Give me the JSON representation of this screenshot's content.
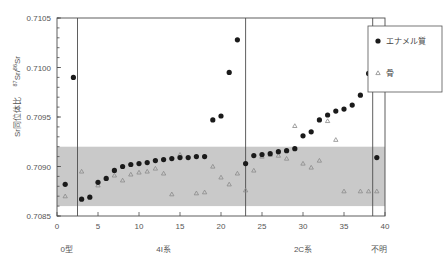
{
  "chart_data": {
    "type": "scatter",
    "title": "",
    "xlabel": "",
    "ylabel": "Sr同位体比  87Sr/86Sr",
    "ylabel_main": "Sr同位体比",
    "ylabel_sup": "87Sr/86Sr",
    "xlim": [
      0,
      40
    ],
    "ylim": [
      0.7085,
      0.7105
    ],
    "xticks": [
      0,
      5,
      10,
      15,
      20,
      25,
      30,
      35,
      40
    ],
    "yticks": [
      0.7085,
      0.709,
      0.7095,
      0.71,
      0.7105
    ],
    "ytick_labels": [
      "0.7085",
      "0.7090",
      "0.7095",
      "0.7100",
      "0.7105"
    ],
    "xtick_labels": [
      "0",
      "5",
      "10",
      "15",
      "20",
      "25",
      "30",
      "35",
      "40"
    ],
    "grid": false,
    "legend_position": "right-top",
    "shaded_band": {
      "label": "local range band",
      "y_min": 0.7086,
      "y_max": 0.7092,
      "color": "#c9c9c9"
    },
    "group_dividers": [
      2.5,
      23.0,
      38.5
    ],
    "group_labels": [
      {
        "label": "0型",
        "x": 1.2
      },
      {
        "label": "4I系",
        "x": 13.0
      },
      {
        "label": "2C系",
        "x": 30.0
      },
      {
        "label": "不明",
        "x": 39.3
      }
    ],
    "series": [
      {
        "name": "エナメル質",
        "marker": "filled-circle",
        "color": "#1a1a1a",
        "points": [
          {
            "x": 1,
            "y": 0.70882
          },
          {
            "x": 2,
            "y": 0.7099
          },
          {
            "x": 3,
            "y": 0.70867
          },
          {
            "x": 4,
            "y": 0.70869
          },
          {
            "x": 5,
            "y": 0.70884
          },
          {
            "x": 6,
            "y": 0.70888
          },
          {
            "x": 7,
            "y": 0.70896
          },
          {
            "x": 8,
            "y": 0.709
          },
          {
            "x": 9,
            "y": 0.70902
          },
          {
            "x": 10,
            "y": 0.70903
          },
          {
            "x": 11,
            "y": 0.70904
          },
          {
            "x": 12,
            "y": 0.70906
          },
          {
            "x": 13,
            "y": 0.70907
          },
          {
            "x": 14,
            "y": 0.70908
          },
          {
            "x": 15,
            "y": 0.70909
          },
          {
            "x": 16,
            "y": 0.70909
          },
          {
            "x": 17,
            "y": 0.7091
          },
          {
            "x": 18,
            "y": 0.7091
          },
          {
            "x": 19,
            "y": 0.70947
          },
          {
            "x": 20,
            "y": 0.70951
          },
          {
            "x": 21,
            "y": 0.70995
          },
          {
            "x": 22,
            "y": 0.71028
          },
          {
            "x": 23,
            "y": 0.70903
          },
          {
            "x": 24,
            "y": 0.70911
          },
          {
            "x": 25,
            "y": 0.70912
          },
          {
            "x": 26,
            "y": 0.70913
          },
          {
            "x": 27,
            "y": 0.70915
          },
          {
            "x": 28,
            "y": 0.70916
          },
          {
            "x": 29,
            "y": 0.70918
          },
          {
            "x": 30,
            "y": 0.70931
          },
          {
            "x": 31,
            "y": 0.70935
          },
          {
            "x": 32,
            "y": 0.70947
          },
          {
            "x": 33,
            "y": 0.70952
          },
          {
            "x": 34,
            "y": 0.70956
          },
          {
            "x": 35,
            "y": 0.70958
          },
          {
            "x": 36,
            "y": 0.70962
          },
          {
            "x": 37,
            "y": 0.70972
          },
          {
            "x": 38,
            "y": 0.70994
          },
          {
            "x": 39,
            "y": 0.70909
          }
        ]
      },
      {
        "name": "骨",
        "marker": "open-triangle",
        "color": "#8a8a8a",
        "points": [
          {
            "x": 1,
            "y": 0.7087
          },
          {
            "x": 3,
            "y": 0.70895
          },
          {
            "x": 5,
            "y": 0.70881
          },
          {
            "x": 6,
            "y": 0.70888
          },
          {
            "x": 7,
            "y": 0.70891
          },
          {
            "x": 8,
            "y": 0.70886
          },
          {
            "x": 9,
            "y": 0.70892
          },
          {
            "x": 10,
            "y": 0.70894
          },
          {
            "x": 11,
            "y": 0.70895
          },
          {
            "x": 12,
            "y": 0.70898
          },
          {
            "x": 13,
            "y": 0.70893
          },
          {
            "x": 14,
            "y": 0.70872
          },
          {
            "x": 15,
            "y": 0.70912
          },
          {
            "x": 17,
            "y": 0.70873
          },
          {
            "x": 18,
            "y": 0.70874
          },
          {
            "x": 19,
            "y": 0.709
          },
          {
            "x": 20,
            "y": 0.70889
          },
          {
            "x": 21,
            "y": 0.70882
          },
          {
            "x": 22,
            "y": 0.70893
          },
          {
            "x": 23,
            "y": 0.70876
          },
          {
            "x": 24,
            "y": 0.70896
          },
          {
            "x": 25,
            "y": 0.7091
          },
          {
            "x": 26,
            "y": 0.70912
          },
          {
            "x": 27,
            "y": 0.70911
          },
          {
            "x": 28,
            "y": 0.70908
          },
          {
            "x": 29,
            "y": 0.70941
          },
          {
            "x": 30,
            "y": 0.70903
          },
          {
            "x": 31,
            "y": 0.70899
          },
          {
            "x": 32,
            "y": 0.70906
          },
          {
            "x": 33,
            "y": 0.70946
          },
          {
            "x": 34,
            "y": 0.70927
          },
          {
            "x": 35,
            "y": 0.70875
          },
          {
            "x": 37,
            "y": 0.70875
          },
          {
            "x": 38,
            "y": 0.70875
          },
          {
            "x": 39,
            "y": 0.70875
          }
        ]
      }
    ],
    "legend": [
      {
        "label": "エナメル質",
        "marker": "filled-circle",
        "color": "#1a1a1a"
      },
      {
        "label": "骨",
        "marker": "open-triangle",
        "color": "#8a8a8a"
      }
    ]
  }
}
